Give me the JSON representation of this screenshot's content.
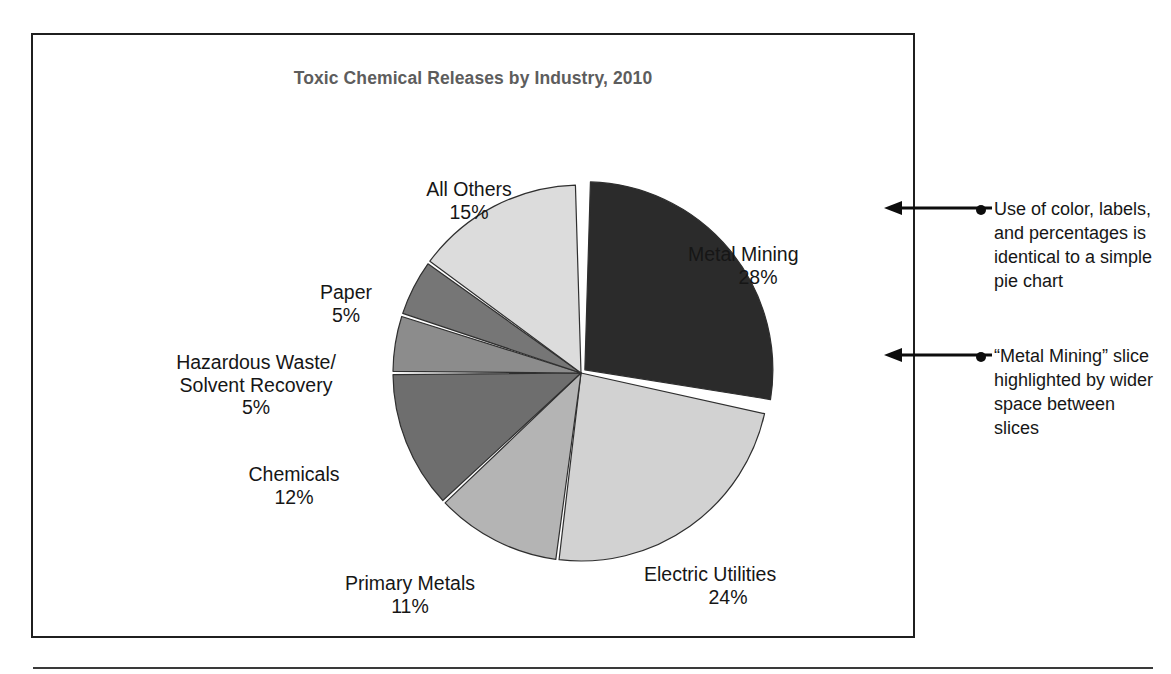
{
  "figure": {
    "title": "Toxic Chemical Releases by Industry, 2010"
  },
  "chart_data": {
    "type": "pie",
    "title": "Toxic Chemical Releases by Industry, 2010",
    "xlabel": "",
    "ylabel": "",
    "units": "percent",
    "legend_position": "none-labels-outside",
    "highlighted_slice": "Metal Mining",
    "categories": [
      "Metal Mining",
      "Electric Utilities",
      "Primary Metals",
      "Chemicals",
      "Hazardous Waste/Solvent Recovery",
      "Paper",
      "All Others"
    ],
    "values": [
      28,
      24,
      11,
      12,
      5,
      5,
      15
    ],
    "colors": [
      "#2b2b2b",
      "#d2d2d2",
      "#b4b4b4",
      "#6e6e6e",
      "#8c8c8c",
      "#767676",
      "#dcdcdc"
    ],
    "slices": [
      {
        "label": "Metal Mining",
        "value": 28,
        "pct_text": "28%",
        "color": "#2b2b2b",
        "exploded": true
      },
      {
        "label": "Electric Utilities",
        "value": 24,
        "pct_text": "24%",
        "color": "#d2d2d2",
        "exploded": false
      },
      {
        "label": "Primary Metals",
        "value": 11,
        "pct_text": "11%",
        "color": "#b4b4b4",
        "exploded": false
      },
      {
        "label": "Chemicals",
        "value": 12,
        "pct_text": "12%",
        "color": "#6e6e6e",
        "exploded": false
      },
      {
        "label": "Hazardous Waste/Solvent Recovery",
        "value": 5,
        "pct_text": "5%",
        "color": "#8c8c8c",
        "exploded": false
      },
      {
        "label": "Paper",
        "value": 5,
        "pct_text": "5%",
        "color": "#767676",
        "exploded": false
      },
      {
        "label": "All Others",
        "value": 15,
        "pct_text": "15%",
        "color": "#dcdcdc",
        "exploded": false
      }
    ]
  },
  "labels": {
    "all_others": {
      "name": "All Others",
      "pct": "15%"
    },
    "metal_mining": {
      "name": "Metal Mining",
      "pct": "28%"
    },
    "paper": {
      "name": "Paper",
      "pct": "5%"
    },
    "hazardous_waste": {
      "name": "Hazardous Waste/\nSolvent Recovery",
      "pct": "5%"
    },
    "chemicals": {
      "name": "Chemicals",
      "pct": "12%"
    },
    "primary_metals": {
      "name": "Primary Metals",
      "pct": "11%"
    },
    "electric_utilities": {
      "name": "Electric Utilities",
      "pct": "24%"
    }
  },
  "annotations": [
    {
      "text": "Use of color, labels, and percentages is identical to a simple pie chart"
    },
    {
      "text": "“Metal Mining” slice highlighted by wider space between slices"
    }
  ]
}
